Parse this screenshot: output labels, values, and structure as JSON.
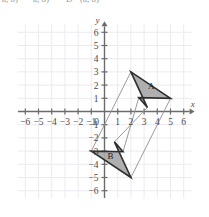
{
  "top_text": {
    "fragments": [
      {
        "text": "a, b)",
        "x": 2
      },
      {
        "text": "a, b)",
        "x": 33
      },
      {
        "text": "D",
        "x": 66
      },
      {
        "text": "(a, b)",
        "x": 80
      }
    ]
  },
  "chart_data": {
    "type": "scatter",
    "title": "",
    "xlabel": "x",
    "ylabel": "y",
    "xlim": [
      -6.6,
      6.6
    ],
    "ylim": [
      -6.6,
      6.6
    ],
    "grid": true,
    "x_ticks": [
      -6,
      -5,
      -4,
      -3,
      -2,
      -1,
      0,
      1,
      2,
      3,
      4,
      5,
      6
    ],
    "y_ticks": [
      -6,
      -5,
      -4,
      -3,
      -2,
      -1,
      1,
      2,
      3,
      4,
      5,
      6
    ],
    "x_tick_labels": [
      "-6",
      "-5",
      "-4",
      "-3",
      "-2",
      "-1",
      "0",
      "1",
      "2",
      "3",
      "4",
      "5",
      "6"
    ],
    "y_tick_labels": [
      "-6",
      "-5",
      "-4",
      "-3",
      "-2",
      "-1",
      "1",
      "2",
      "3",
      "4",
      "5",
      "6"
    ],
    "origin_label": "0",
    "shapes": [
      {
        "name": "A",
        "label": "A",
        "label_at": [
          3.55,
          1.72
        ],
        "vertices": [
          [
            2,
            3
          ],
          [
            5,
            1
          ],
          [
            2.6,
            1.05
          ],
          [
            3.25,
            0.3
          ]
        ]
      },
      {
        "name": "B",
        "label": "B",
        "label_at": [
          0.45,
          -3.62
        ],
        "vertices": [
          [
            2,
            -5
          ],
          [
            -1,
            -3
          ],
          [
            1.4,
            -3.05
          ],
          [
            0.75,
            -2.3
          ]
        ]
      }
    ],
    "connectors": [
      {
        "from": [
          2,
          3
        ],
        "to": [
          -1,
          -3
        ]
      },
      {
        "from": [
          5,
          1
        ],
        "to": [
          2,
          -5
        ]
      },
      {
        "from": [
          2.6,
          1.05
        ],
        "to": [
          1.4,
          -3.05
        ]
      },
      {
        "from": [
          3.25,
          0.3
        ],
        "to": [
          0.75,
          -2.3
        ]
      }
    ],
    "center_of_rotation": [
      2,
      -1
    ],
    "annotations": []
  }
}
